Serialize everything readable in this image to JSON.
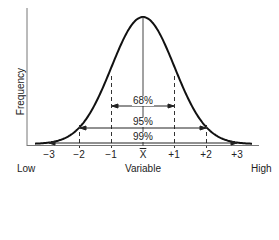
{
  "chart_data": {
    "type": "line",
    "title": "",
    "xlabel": "Variable",
    "ylabel": "Frequency",
    "x_axis_ends": {
      "left": "Low",
      "right": "High"
    },
    "x_ticks": [
      "-3",
      "-2",
      "-1",
      "X̄",
      "+1",
      "+2",
      "+3"
    ],
    "intervals": [
      {
        "label": "68%",
        "from": "-1",
        "to": "+1"
      },
      {
        "label": "95%",
        "from": "-2",
        "to": "+2"
      },
      {
        "label": "99%",
        "from": "-3",
        "to": "+3"
      }
    ],
    "grid": false
  },
  "labels": {
    "ylabel": "Frequency",
    "xlabel": "Variable",
    "low": "Low",
    "high": "High",
    "ticks": [
      "−3",
      "−2",
      "−1",
      "X",
      "+1",
      "+2",
      "+3"
    ],
    "p68": "68%",
    "p95": "95%",
    "p99": "99%"
  },
  "colors": {
    "line": "#111111",
    "text": "#222222"
  }
}
